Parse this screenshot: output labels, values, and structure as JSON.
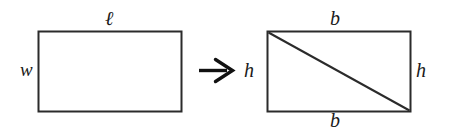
{
  "figure": {
    "background_color": "#ffffff",
    "stroke_color": "#2b2b2b",
    "text_color": "#1a1a1a",
    "left_shape": {
      "name": "rectangle",
      "top_label": "ℓ",
      "left_label": "w",
      "x": 38,
      "y": 31,
      "width": 144,
      "height": 81
    },
    "transform": {
      "glyph": "→",
      "meaning": "arrow-right"
    },
    "right_shape": {
      "name": "rectangle-with-diagonal",
      "top_label": "b",
      "bottom_label": "b",
      "left_label": "h",
      "right_label": "h",
      "x": 267,
      "y": 31,
      "width": 144,
      "height": 81,
      "diagonal": "top-left-to-bottom-right"
    }
  }
}
